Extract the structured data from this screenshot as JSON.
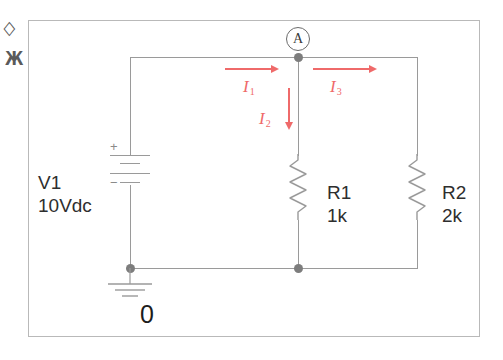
{
  "figure": {
    "type": "electrical-circuit-schematic"
  },
  "edge_marks": {
    "mark_top": "◇",
    "mark_bottom": "Ж"
  },
  "nodes": {
    "a_label": "A",
    "ground_label": "0"
  },
  "components": [
    {
      "id": "V1",
      "kind": "dc-voltage-source",
      "ref": "V1",
      "value": "10Vdc",
      "plus_sign": "+",
      "minus_sign": "−"
    },
    {
      "id": "R1",
      "kind": "resistor",
      "ref": "R1",
      "value": "1k"
    },
    {
      "id": "R2",
      "kind": "resistor",
      "ref": "R2",
      "value": "2k"
    }
  ],
  "currents": [
    {
      "id": "I1",
      "symbol": "I",
      "subscript": "1",
      "direction": "right"
    },
    {
      "id": "I2",
      "symbol": "I",
      "subscript": "2",
      "direction": "down"
    },
    {
      "id": "I3",
      "symbol": "I",
      "subscript": "3",
      "direction": "right"
    }
  ],
  "colors": {
    "wire": "#9a9a9a",
    "node": "#7d7d7d",
    "current_arrow": "#ef6a6a",
    "text": "#2e2e2e",
    "frame": "#b9b9b9",
    "background": "#ffffff"
  }
}
